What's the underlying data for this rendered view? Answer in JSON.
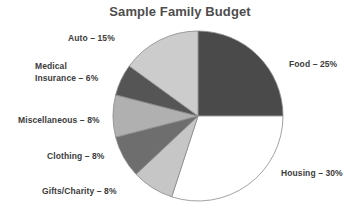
{
  "chart_data": {
    "type": "pie",
    "title": "Sample Family Budget",
    "xlabel": "",
    "ylabel": "",
    "legend_position": "none",
    "grid": false,
    "start_angle_deg": 0,
    "direction": "clockwise",
    "categories": [
      "Food",
      "Housing",
      "Gifts/Charity",
      "Clothing",
      "Miscellaneous",
      "Medical Insurance",
      "Auto"
    ],
    "values": [
      25,
      30,
      8,
      8,
      8,
      6,
      15
    ],
    "units": "percent",
    "slices": [
      {
        "name": "Food",
        "value": 25,
        "label": "Food – 25%",
        "color": "#4a4a4a"
      },
      {
        "name": "Housing",
        "value": 30,
        "label": "Housing – 30%",
        "color": "#ffffff"
      },
      {
        "name": "Gifts/Charity",
        "value": 8,
        "label": "Gifts/Charity – 8%",
        "color": "#c6c6c6"
      },
      {
        "name": "Clothing",
        "value": 8,
        "label": "Clothing – 8%",
        "color": "#6e6e6e"
      },
      {
        "name": "Miscellaneous",
        "value": 8,
        "label": "Miscellaneous – 8%",
        "color": "#b0b0b0"
      },
      {
        "name": "Medical Insurance",
        "value": 6,
        "label": "Insurance – 6%",
        "color": "#555555"
      },
      {
        "name": "Auto",
        "value": 15,
        "label": "Auto – 15%",
        "color": "#cccccc"
      }
    ]
  },
  "labels": {
    "food": "Food – 25%",
    "housing": "Housing – 30%",
    "gifts": "Gifts/Charity – 8%",
    "clothing": "Clothing – 8%",
    "miscellaneous": "Miscellaneous – 8%",
    "medical_line1": "Medical",
    "medical_line2": "Insurance – 6%",
    "auto": "Auto – 15%"
  },
  "colors": {
    "outline": "#8a8a8a",
    "text": "#3c3c3c",
    "title": "#4d4d4d",
    "background": "#ffffff"
  }
}
